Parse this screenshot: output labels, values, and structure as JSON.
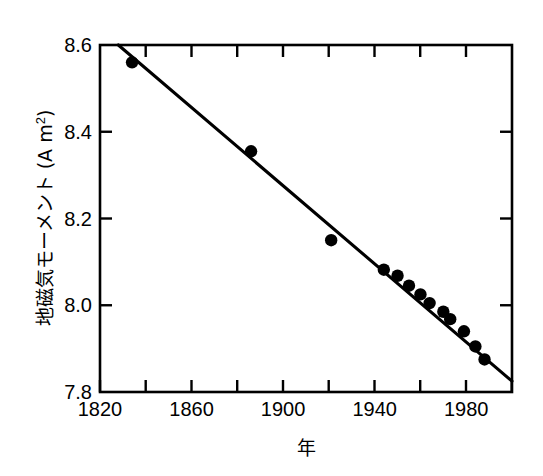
{
  "chart_data": {
    "type": "scatter",
    "title": "",
    "xlabel": "年",
    "ylabel_main": "地磁気モーメント (A m",
    "ylabel_exponent": "2",
    "ylabel_tail": ")",
    "ylabel_full": "地磁気モーメント (A m2)",
    "xlim": [
      1820,
      2000
    ],
    "ylim": [
      7.8,
      8.6
    ],
    "x_ticks_major": [
      1820,
      1860,
      1900,
      1940,
      1980
    ],
    "x_tick_labels": [
      "1820",
      "1860",
      "1900",
      "1940",
      "1980"
    ],
    "x_ticks_minor": [
      1840,
      1880,
      1920,
      1960,
      2000
    ],
    "y_ticks_major": [
      7.8,
      8.0,
      8.2,
      8.4,
      8.6
    ],
    "y_tick_labels": [
      "7.8",
      "8.0",
      "8.2",
      "8.4",
      "8.6"
    ],
    "grid": false,
    "legend": "none",
    "marker_style": "filled-circle",
    "marker_color": "#000000",
    "line_color": "#000000",
    "frame_color": "#000000",
    "background_color": "#ffffff",
    "series": [
      {
        "name": "geomagnetic dipole moment",
        "x": [
          1834,
          1886,
          1921,
          1944,
          1950,
          1955,
          1960,
          1964,
          1970,
          1973,
          1979,
          1984,
          1988
        ],
        "y": [
          8.56,
          8.355,
          8.15,
          8.082,
          8.068,
          8.045,
          8.025,
          8.005,
          7.985,
          7.968,
          7.94,
          7.905,
          7.875
        ]
      }
    ],
    "trend_line": {
      "name": "linear fit",
      "x": [
        1828,
        2000
      ],
      "y": [
        8.6,
        7.825
      ]
    }
  }
}
